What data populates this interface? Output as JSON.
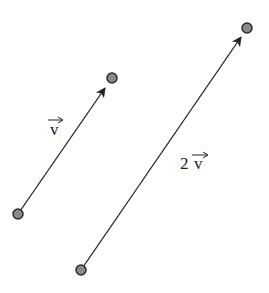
{
  "diagram": {
    "colors": {
      "line": "#222222",
      "point_fill": "#8a8a8a",
      "point_stroke": "#2a2a2a",
      "background": "#ffffff"
    },
    "vectors": [
      {
        "id": "v",
        "label": "v",
        "coefficient": "",
        "start": [
          18,
          214
        ],
        "end": [
          112,
          78
        ],
        "label_pos": [
          56,
          133
        ]
      },
      {
        "id": "2v",
        "label": "v",
        "coefficient": "2",
        "start": [
          81,
          270
        ],
        "end": [
          247,
          28
        ],
        "label_pos": [
          180,
          167
        ]
      }
    ]
  }
}
